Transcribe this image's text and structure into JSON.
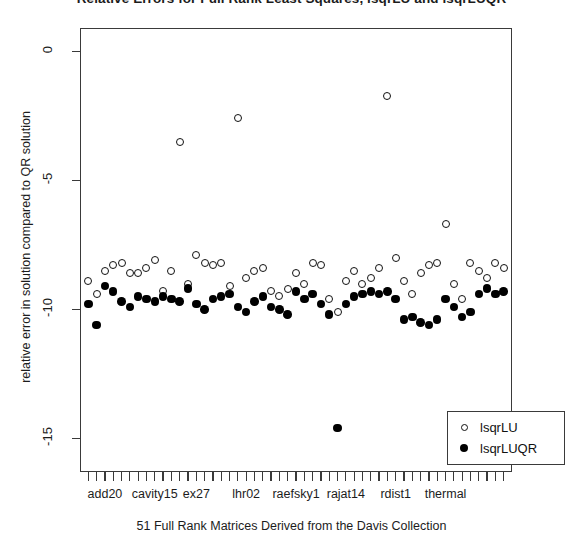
{
  "chart_data": {
    "type": "scatter",
    "title": "Relative Errors for Full Rank Least Squares, lsqrLU and lsqrLUQR",
    "xlabel": "51 Full Rank Matrices Derived from the Davis Collection",
    "ylabel": "relative error in solution compared to QR solution",
    "xlim": [
      0,
      52
    ],
    "ylim": [
      -16.3,
      0.9
    ],
    "grid": false,
    "legend_position": "bottom-right",
    "yticks": [
      0,
      -5,
      -10,
      -15
    ],
    "ytick_labels": [
      "0",
      "-5",
      "-10",
      "-15"
    ],
    "xtick_labels": [
      "add20",
      "cavity15",
      "ex27",
      "lhr02",
      "raefsky1",
      "rajat14",
      "rdist1",
      "thermal"
    ],
    "xtick_label_positions": [
      3,
      9,
      14,
      20,
      26,
      32,
      38,
      44
    ],
    "n_xticks": 51,
    "series": [
      {
        "name": "lsqrLU",
        "marker": "open-circle",
        "color": "#111111",
        "x": [
          1,
          2,
          3,
          4,
          5,
          6,
          7,
          8,
          9,
          10,
          11,
          12,
          13,
          14,
          15,
          16,
          17,
          18,
          19,
          20,
          21,
          22,
          23,
          24,
          25,
          26,
          27,
          28,
          29,
          30,
          31,
          32,
          33,
          34,
          35,
          36,
          37,
          38,
          39,
          40,
          41,
          42,
          43,
          44,
          45,
          46,
          47,
          48,
          49,
          50,
          51
        ],
        "values": [
          -8.9,
          -9.4,
          -8.5,
          -8.3,
          -8.2,
          -8.6,
          -8.6,
          -8.4,
          -8.1,
          -9.3,
          -8.5,
          -3.5,
          -9.0,
          -7.9,
          -8.2,
          -8.3,
          -8.2,
          -9.1,
          -2.6,
          -8.8,
          -8.5,
          -8.4,
          -9.3,
          -9.5,
          -9.2,
          -8.6,
          -9.0,
          -8.2,
          -8.3,
          -9.6,
          -10.1,
          -8.9,
          -8.5,
          -9.0,
          -8.8,
          -8.4,
          -1.75,
          -8.0,
          -8.9,
          -9.4,
          -8.6,
          -8.3,
          -8.2,
          -6.7,
          -9.0,
          -9.6,
          -8.2,
          -8.5,
          -8.8,
          -8.2,
          -8.4
        ]
      },
      {
        "name": "lsqrLUQR",
        "marker": "filled-circle",
        "color": "#000000",
        "x": [
          1,
          2,
          3,
          4,
          5,
          6,
          7,
          8,
          9,
          10,
          11,
          12,
          13,
          14,
          15,
          16,
          17,
          18,
          19,
          20,
          21,
          22,
          23,
          24,
          25,
          26,
          27,
          28,
          29,
          30,
          31,
          32,
          33,
          34,
          35,
          36,
          37,
          38,
          39,
          40,
          41,
          42,
          43,
          44,
          45,
          46,
          47,
          48,
          49,
          50,
          51
        ],
        "values": [
          -9.8,
          -10.6,
          -9.1,
          -9.3,
          -9.7,
          -9.9,
          -9.5,
          -9.6,
          -9.7,
          -9.5,
          -9.6,
          -9.7,
          -9.2,
          -9.8,
          -10.0,
          -9.6,
          -9.5,
          -9.4,
          -9.9,
          -10.1,
          -9.7,
          -9.5,
          -9.9,
          -10.0,
          -10.2,
          -9.3,
          -9.6,
          -9.4,
          -9.8,
          -10.2,
          -14.6,
          -9.8,
          -9.5,
          -9.4,
          -9.3,
          -9.4,
          -9.3,
          -9.6,
          -10.4,
          -10.3,
          -10.5,
          -10.6,
          -10.4,
          -9.6,
          -9.9,
          -10.3,
          -10.1,
          -9.4,
          -9.2,
          -9.4,
          -9.3
        ]
      }
    ]
  },
  "axes": {
    "y_title": "relative error in solution compared to QR solution",
    "x_title": "51 Full Rank Matrices Derived from the Davis Collection"
  },
  "legend": {
    "entries": [
      {
        "label": "lsqrLU",
        "marker": "open-circle"
      },
      {
        "label": "lsqrLUQR",
        "marker": "filled-circle"
      }
    ]
  },
  "title": "Relative Errors for Full Rank Least Squares, lsqrLU and lsqrLUQR"
}
